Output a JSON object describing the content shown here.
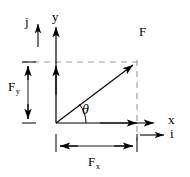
{
  "figure": {
    "type": "force-vector-decomposition-diagram",
    "background_color": "#ffffff",
    "stroke_color": "#000000",
    "dash_color": "#9a9a9a"
  },
  "labels": {
    "force_vector": "F",
    "x_axis": "x",
    "y_axis": "y",
    "unit_vector_i": "i",
    "unit_vector_j": "j",
    "angle": "θ",
    "component_x_main": "F",
    "component_x_sub": "x",
    "component_y_main": "F",
    "component_y_sub": "y"
  },
  "geometry": {
    "origin": {
      "x": 56,
      "y": 123
    },
    "force_tip": {
      "x": 137,
      "y": 62
    },
    "x_axis_end": {
      "x": 158,
      "y": 123
    },
    "y_axis_top": {
      "x": 56,
      "y": 22
    },
    "fy_dimension_line_x": 28,
    "fx_dimension_line_y": 146,
    "angle_arc_radius": 30
  }
}
